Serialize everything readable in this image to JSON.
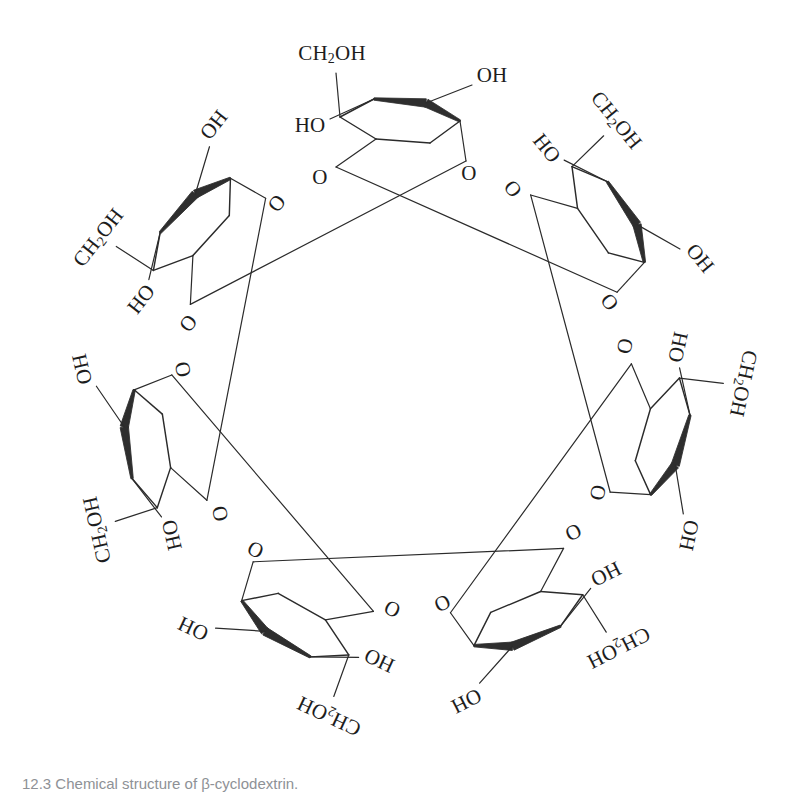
{
  "figure": {
    "molecule_name": "beta-cyclodextrin",
    "unit_count": 7,
    "ring_cavity": "empty",
    "background_color": "#ffffff",
    "line_color": "#2b2b2b",
    "wedge_color": "#2e2e2e",
    "label_color": "#1d1d1d"
  },
  "caption": {
    "text": "12.3   Chemical structure of β-cyclodextrin.",
    "color": "#8e9196",
    "clipped": true
  },
  "labels": {
    "ch2oh": "CH",
    "ch2oh_sub": "2",
    "ch2oh_tail": "OH",
    "oh": "OH",
    "ho": "HO",
    "o": "O"
  },
  "chart_data": {
    "type": "diagram",
    "title": "Chemical structure of β-cyclodextrin",
    "units": [
      {
        "index": 1,
        "position": "top",
        "angle_deg": 270,
        "ch2oh": "CH2OH",
        "hydroxyls": [
          "OH",
          "HO"
        ],
        "ring_oxygen": "O",
        "glycosidic_oxygen": "O"
      },
      {
        "index": 2,
        "position": "top-right",
        "angle_deg": 321,
        "ch2oh": "CH2OH",
        "hydroxyls": [
          "HO",
          "OH"
        ],
        "ring_oxygen": "O",
        "glycosidic_oxygen": "O"
      },
      {
        "index": 3,
        "position": "right",
        "angle_deg": 12,
        "ch2oh": "CH2OH",
        "hydroxyls": [
          "HO",
          "HO"
        ],
        "ring_oxygen": "O",
        "glycosidic_oxygen": "O"
      },
      {
        "index": 4,
        "position": "bottom-right",
        "angle_deg": 63,
        "ch2oh": "CH2OH",
        "hydroxyls": [
          "OH",
          "HO"
        ],
        "ring_oxygen": "O",
        "glycosidic_oxygen": "O"
      },
      {
        "index": 5,
        "position": "bottom",
        "angle_deg": 115,
        "ch2oh": "CH2OH",
        "hydroxyls": [
          "HO",
          "OH"
        ],
        "ring_oxygen": "O",
        "glycosidic_oxygen": "O"
      },
      {
        "index": 6,
        "position": "bottom-left",
        "angle_deg": 167,
        "ch2oh": "CH2OH",
        "hydroxyls": [
          "HO",
          "OH"
        ],
        "ring_oxygen": "O",
        "glycosidic_oxygen": "O"
      },
      {
        "index": 7,
        "position": "left",
        "angle_deg": 218,
        "ch2oh": "CH2OH",
        "hydroxyls": [
          "OH",
          "HO"
        ],
        "ring_oxygen": "O",
        "glycosidic_oxygen": "O"
      }
    ],
    "label_totals": {
      "CH2OH": 7,
      "OH": 7,
      "HO": 7,
      "ring_O": 7,
      "glycosidic_O": 7
    }
  }
}
